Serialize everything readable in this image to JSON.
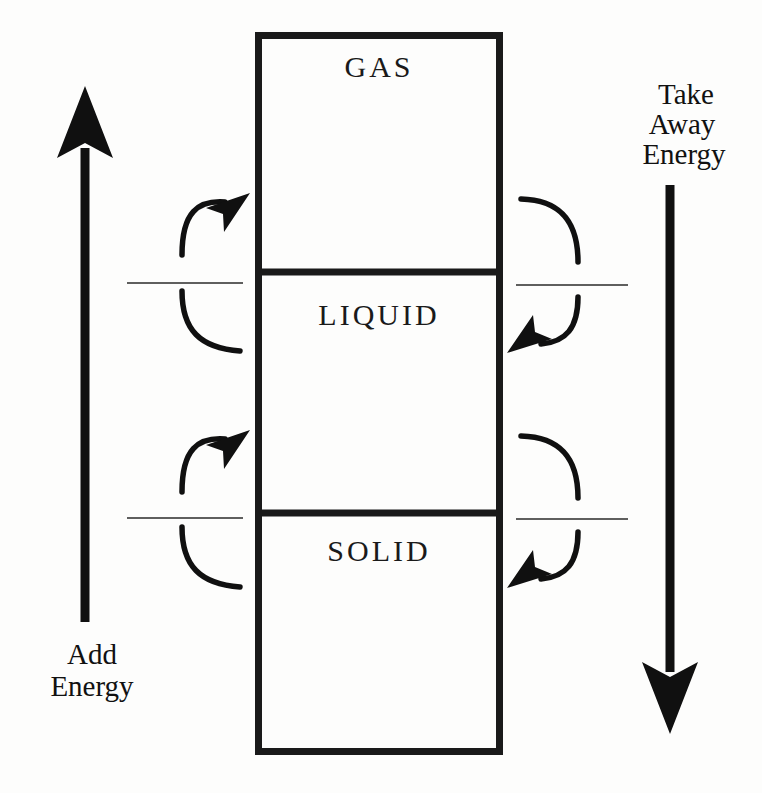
{
  "diagram": {
    "background_color": "#fdfdfc",
    "ink_color": "#101010",
    "states": [
      {
        "id": "gas",
        "label": "GAS",
        "label_x": 379,
        "label_y": 68,
        "box_top": 32,
        "box_bottom": 272
      },
      {
        "id": "liquid",
        "label": "LIQUID",
        "label_x": 379,
        "label_y": 316,
        "box_top": 272,
        "box_bottom": 513
      },
      {
        "id": "solid",
        "label": "SOLID",
        "label_x": 379,
        "label_y": 552,
        "box_top": 513,
        "box_bottom": 755
      }
    ],
    "box": {
      "left": 255,
      "right": 503,
      "top": 32,
      "bottom": 755,
      "stroke_width": 7
    },
    "dividers": [
      {
        "id": "gas-liquid-divider",
        "y": 272
      },
      {
        "id": "liquid-solid-divider",
        "y": 513
      }
    ],
    "tick_lines": [
      {
        "id": "tick-left-upper",
        "x1": 127,
        "x2": 243,
        "y": 283
      },
      {
        "id": "tick-right-upper",
        "x1": 516,
        "x2": 628,
        "y": 285
      },
      {
        "id": "tick-left-lower",
        "x1": 127,
        "x2": 243,
        "y": 518
      },
      {
        "id": "tick-right-lower",
        "x1": 516,
        "x2": 628,
        "y": 519
      }
    ],
    "add_energy_arrow": {
      "id": "add-energy-arrow",
      "direction": "up",
      "label_lines": [
        "Add",
        "Energy"
      ],
      "label_x": 92,
      "label_line1_y": 664,
      "label_line2_y": 696,
      "shaft_x": 85,
      "shaft_top": 148,
      "shaft_bottom": 622,
      "head_tip_y": 86
    },
    "take_away_energy_arrow": {
      "id": "take-away-energy-arrow",
      "direction": "down",
      "label_lines": [
        "Take",
        "Away",
        "Energy"
      ],
      "label_x": 730,
      "label_line1_y": 104,
      "label_line2_y": 134,
      "label_line3_y": 164,
      "shaft_x": 670,
      "shaft_top": 185,
      "shaft_bottom": 672,
      "head_tip_y": 734
    },
    "curved_arrows": [
      {
        "id": "curve-melt-upper-left",
        "side": "left",
        "meaning": "add energy: liquid to gas",
        "head_direction": "up-right"
      },
      {
        "id": "curve-condense-upper-right",
        "side": "right",
        "meaning": "take away energy: gas to liquid",
        "head_direction": "down-left"
      },
      {
        "id": "curve-melt-lower-left",
        "side": "left",
        "meaning": "add energy: solid to liquid",
        "head_direction": "up-right"
      },
      {
        "id": "curve-freeze-lower-right",
        "side": "right",
        "meaning": "take away energy: liquid to solid",
        "head_direction": "down-left"
      }
    ]
  }
}
